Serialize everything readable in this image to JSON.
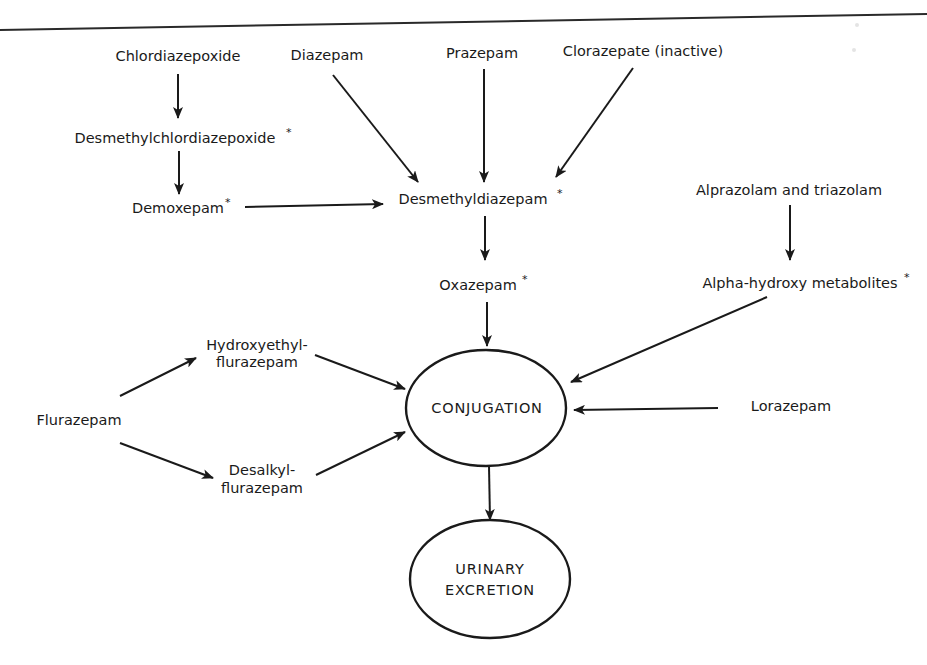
{
  "diagram": {
    "type": "flowchart",
    "colors": {
      "ink": "#1a1a1a",
      "background": "#ffffff"
    },
    "nodes": {
      "chlordiazepoxide": {
        "label": "Chlordiazepoxide",
        "active_metabolite": false
      },
      "desmethylchlordiazepoxide": {
        "label": "Desmethylchlordiazepoxide",
        "marker": "*",
        "active_metabolite": true
      },
      "demoxepam": {
        "label": "Demoxepam",
        "marker": "*",
        "active_metabolite": true
      },
      "diazepam": {
        "label": "Diazepam",
        "active_metabolite": false
      },
      "prazepam": {
        "label": "Prazepam",
        "active_metabolite": false
      },
      "clorazepate": {
        "label": "Clorazepate (inactive)",
        "active_metabolite": false
      },
      "desmethyldiazepam": {
        "label": "Desmethyldiazepam",
        "marker": "*",
        "active_metabolite": true
      },
      "oxazepam": {
        "label": "Oxazepam",
        "marker": "*",
        "active_metabolite": true
      },
      "alprazolam_triazolam": {
        "label": "Alprazolam and triazolam",
        "active_metabolite": false
      },
      "alpha_hydroxy": {
        "label": "Alpha-hydroxy metabolites",
        "marker": "*",
        "active_metabolite": true
      },
      "lorazepam": {
        "label": "Lorazepam",
        "active_metabolite": false
      },
      "flurazepam": {
        "label": "Flurazepam",
        "active_metabolite": false
      },
      "hydroxyethylflurazepam": {
        "line1": "Hydroxyethyl-",
        "line2": "flurazepam"
      },
      "desalkylflurazepam": {
        "line1": "Desalkyl-",
        "line2": "flurazepam"
      },
      "conjugation": {
        "label": "CONJUGATION",
        "shape": "ellipse"
      },
      "urinary_excretion": {
        "line1": "URINARY",
        "line2": "EXCRETION",
        "shape": "ellipse"
      }
    },
    "edges": [
      {
        "from": "Chlordiazepoxide",
        "to": "Desmethylchlordiazepoxide"
      },
      {
        "from": "Desmethylchlordiazepoxide",
        "to": "Demoxepam"
      },
      {
        "from": "Demoxepam",
        "to": "Desmethyldiazepam"
      },
      {
        "from": "Diazepam",
        "to": "Desmethyldiazepam"
      },
      {
        "from": "Prazepam",
        "to": "Desmethyldiazepam"
      },
      {
        "from": "Clorazepate (inactive)",
        "to": "Desmethyldiazepam"
      },
      {
        "from": "Desmethyldiazepam",
        "to": "Oxazepam"
      },
      {
        "from": "Oxazepam",
        "to": "CONJUGATION"
      },
      {
        "from": "Alprazolam and triazolam",
        "to": "Alpha-hydroxy metabolites"
      },
      {
        "from": "Alpha-hydroxy metabolites",
        "to": "CONJUGATION"
      },
      {
        "from": "Lorazepam",
        "to": "CONJUGATION"
      },
      {
        "from": "Flurazepam",
        "to": "Hydroxyethylflurazepam"
      },
      {
        "from": "Flurazepam",
        "to": "Desalkylflurazepam"
      },
      {
        "from": "Hydroxyethylflurazepam",
        "to": "CONJUGATION"
      },
      {
        "from": "Desalkylflurazepam",
        "to": "CONJUGATION"
      },
      {
        "from": "CONJUGATION",
        "to": "URINARY EXCRETION"
      }
    ]
  }
}
